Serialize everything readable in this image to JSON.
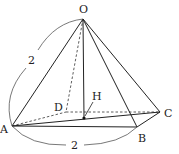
{
  "diagram": {
    "type": "square pyramid",
    "vertices": {
      "O": {
        "label": "O",
        "x": 83,
        "y": 19
      },
      "A": {
        "label": "A",
        "x": 12,
        "y": 126
      },
      "B": {
        "label": "B",
        "x": 137,
        "y": 127
      },
      "C": {
        "label": "C",
        "x": 160,
        "y": 112
      },
      "D": {
        "label": "D",
        "x": 66,
        "y": 112
      },
      "H": {
        "label": "H",
        "x": 84,
        "y": 118
      }
    },
    "dimensions": {
      "OA": "2",
      "AB": "2"
    },
    "colors": {
      "line": "#222222",
      "arc": "#555555"
    }
  }
}
